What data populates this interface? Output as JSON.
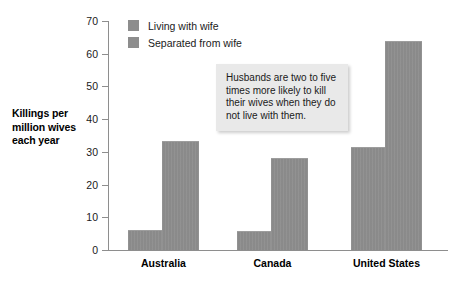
{
  "chart_data": {
    "type": "bar",
    "title": "",
    "xlabel": "",
    "ylabel": "Killings per million wives each year",
    "ylim": [
      0,
      70
    ],
    "yticks": [
      0,
      10,
      20,
      30,
      40,
      50,
      60,
      70
    ],
    "grid": false,
    "legend_position": "top-left",
    "categories": [
      "Australia",
      "Canada",
      "United States"
    ],
    "series": [
      {
        "name": "Living with wife",
        "values": [
          6.0,
          5.7,
          31.6
        ],
        "color": "#8d8d8d"
      },
      {
        "name": "Separated from wife",
        "values": [
          33.3,
          28.0,
          64.0
        ],
        "color": "#8d8d8d"
      }
    ],
    "annotations": [
      "Husbands are two to five times more likely to kill their wives when they do not live with them."
    ]
  },
  "axis": {
    "y_title_lines": [
      "Killings per",
      "million wives",
      "each year"
    ],
    "y_tick_labels": [
      "70",
      "60",
      "50",
      "40",
      "30",
      "20",
      "10",
      "0"
    ]
  },
  "legend": {
    "items": [
      {
        "label": "Living with wife"
      },
      {
        "label": "Separated from wife"
      }
    ]
  },
  "callout": {
    "text": "Husbands are two to five times more likely to kill their wives when they do not live with them."
  },
  "colors": {
    "bar": "#8d8d8d",
    "axis": "#8e8e8e",
    "callout_bg": "#e9e9e9",
    "text": "#1a1a1a",
    "background": "#ffffff"
  }
}
